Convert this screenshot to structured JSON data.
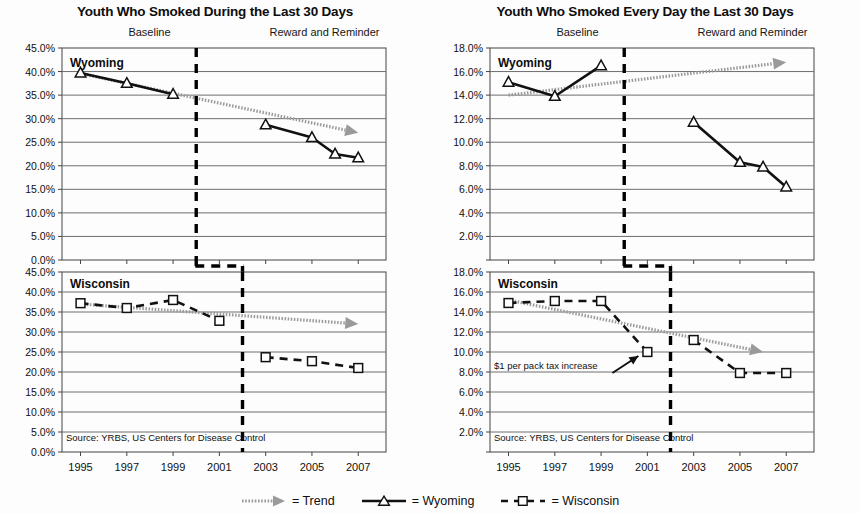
{
  "figure": {
    "legend": [
      {
        "key": "trend",
        "marker": "dotted-arrow",
        "label": "= Trend"
      },
      {
        "key": "wyoming",
        "marker": "solid-triangle",
        "label": "= Wyoming"
      },
      {
        "key": "wisconsin",
        "marker": "dashed-square",
        "label": "= Wisconsin"
      }
    ],
    "colors": {
      "series_line": "#111111",
      "trend_line": "#9a9a9a",
      "grid": "#6e6e6e",
      "axis": "#444444",
      "divider": "#000000",
      "background": "#ffffff"
    }
  },
  "charts": [
    {
      "id": "left",
      "title": "Youth Who Smoked During the Last 30 Days",
      "phase_labels": {
        "baseline": "Baseline",
        "intervention": "Reward and Reminder"
      },
      "xlabel": "",
      "ylabel": "",
      "xticks": [
        "1995",
        "1997",
        "1999",
        "2001",
        "2003",
        "2005",
        "2007"
      ],
      "x": [
        1995,
        1997,
        1999,
        2001,
        2003,
        2005,
        2007
      ],
      "yticks": [
        "0.0%",
        "5.0%",
        "10.0%",
        "15.0%",
        "20.0%",
        "25.0%",
        "30.0%",
        "35.0%",
        "40.0%",
        "45.0%"
      ],
      "ylim": [
        0,
        45
      ],
      "ystep": 5,
      "divider_year": 2002,
      "grid": true,
      "source_note": "Source: YRBS, US Centers for Disease Control",
      "panels": [
        {
          "state": "Wyoming",
          "series_name": "Wyoming",
          "baseline": {
            "x": [
              1995,
              1997,
              1999
            ],
            "values": [
              39.7,
              37.5,
              35.2
            ]
          },
          "intervention": {
            "x": [
              2003,
              2005,
              2006,
              2007
            ],
            "values": [
              28.7,
              26.0,
              22.5,
              21.7
            ]
          },
          "trend": {
            "x": [
              1995,
              2007
            ],
            "values": [
              39.6,
              27.0
            ]
          },
          "has_source_note": false,
          "annotation": null
        },
        {
          "state": "Wisconsin",
          "series_name": "Wisconsin",
          "baseline": {
            "x": [
              1995,
              1997,
              1999,
              2001
            ],
            "values": [
              37.2,
              36.0,
              38.0,
              32.8
            ]
          },
          "intervention": {
            "x": [
              2003,
              2005,
              2007
            ],
            "values": [
              23.7,
              22.7,
              21.0
            ]
          },
          "trend": {
            "x": [
              1995,
              2007
            ],
            "values": [
              37.0,
              32.0
            ]
          },
          "has_source_note": true,
          "annotation": null
        }
      ]
    },
    {
      "id": "right",
      "title": "Youth Who Smoked Every Day the Last 30 Days",
      "phase_labels": {
        "baseline": "Baseline",
        "intervention": "Reward and Reminder"
      },
      "xlabel": "",
      "ylabel": "",
      "xticks": [
        "1995",
        "1997",
        "1999",
        "2001",
        "2003",
        "2005",
        "2007"
      ],
      "x": [
        1995,
        1997,
        1999,
        2001,
        2003,
        2005,
        2007
      ],
      "yticks": [
        "2.0%",
        "4.0%",
        "6.0%",
        "8.0%",
        "10.0%",
        "12.0%",
        "14.0%",
        "16.0%",
        "18.0%"
      ],
      "ylim": [
        0,
        18
      ],
      "ystep": 2,
      "divider_year": 2002,
      "grid": true,
      "source_note": "Source: YRBS, US Centers for Disease Control",
      "panels": [
        {
          "state": "Wyoming",
          "series_name": "Wyoming",
          "baseline": {
            "x": [
              1995,
              1997,
              1999
            ],
            "values": [
              15.1,
              13.9,
              16.5
            ]
          },
          "intervention": {
            "x": [
              2003,
              2005,
              2006,
              2007
            ],
            "values": [
              11.7,
              8.3,
              7.9,
              6.2
            ]
          },
          "trend": {
            "x": [
              1995,
              2007
            ],
            "values": [
              14.0,
              16.8
            ]
          },
          "has_source_note": false,
          "annotation": null
        },
        {
          "state": "Wisconsin",
          "series_name": "Wisconsin",
          "baseline": {
            "x": [
              1995,
              1997,
              1999,
              2001
            ],
            "values": [
              14.9,
              15.1,
              15.1,
              10.0
            ]
          },
          "intervention": {
            "x": [
              2003,
              2005,
              2007
            ],
            "values": [
              11.2,
              7.9,
              7.9
            ]
          },
          "trend": {
            "x": [
              1995,
              2006
            ],
            "values": [
              15.2,
              10.0
            ]
          },
          "has_source_note": true,
          "annotation": {
            "text": "$1 per pack tax increase",
            "points_to_year": 2001,
            "points_to_value": 10.0
          }
        }
      ]
    }
  ],
  "chart_data": {
    "type": "line",
    "xlabel": "Year",
    "ylabel": "Percent of youth",
    "x": [
      1995,
      1997,
      1999,
      2001,
      2003,
      2005,
      2007
    ],
    "panels": [
      {
        "chart": "Youth Who Smoked During the Last 30 Days",
        "ylim": [
          0,
          45
        ],
        "yticks": [
          0,
          5,
          10,
          15,
          20,
          25,
          30,
          35,
          40,
          45
        ],
        "series": [
          {
            "name": "Wyoming",
            "x": [
              1995,
              1997,
              1999,
              2003,
              2005,
              2006,
              2007
            ],
            "values": [
              39.7,
              37.5,
              35.2,
              28.7,
              26.0,
              22.5,
              21.7
            ]
          },
          {
            "name": "Wyoming Trend",
            "x": [
              1995,
              2007
            ],
            "values": [
              39.6,
              27.0
            ]
          },
          {
            "name": "Wisconsin",
            "x": [
              1995,
              1997,
              1999,
              2001,
              2003,
              2005,
              2007
            ],
            "values": [
              37.2,
              36.0,
              38.0,
              32.8,
              23.7,
              22.7,
              21.0
            ]
          },
          {
            "name": "Wisconsin Trend",
            "x": [
              1995,
              2007
            ],
            "values": [
              37.0,
              32.0
            ]
          }
        ]
      },
      {
        "chart": "Youth Who Smoked Every Day the Last 30 Days",
        "ylim": [
          0,
          18
        ],
        "yticks": [
          2,
          4,
          6,
          8,
          10,
          12,
          14,
          16,
          18
        ],
        "series": [
          {
            "name": "Wyoming",
            "x": [
              1995,
              1997,
              1999,
              2003,
              2005,
              2006,
              2007
            ],
            "values": [
              15.1,
              13.9,
              16.5,
              11.7,
              8.3,
              7.9,
              6.2
            ]
          },
          {
            "name": "Wyoming Trend",
            "x": [
              1995,
              2007
            ],
            "values": [
              14.0,
              16.8
            ]
          },
          {
            "name": "Wisconsin",
            "x": [
              1995,
              1997,
              1999,
              2001,
              2003,
              2005,
              2007
            ],
            "values": [
              14.9,
              15.1,
              15.1,
              10.0,
              11.2,
              7.9,
              7.9
            ]
          },
          {
            "name": "Wisconsin Trend",
            "x": [
              1995,
              2006
            ],
            "values": [
              15.2,
              10.0
            ]
          }
        ],
        "annotations": [
          {
            "text": "$1 per pack tax increase",
            "x": 2001,
            "y": 10.0
          }
        ]
      }
    ],
    "legend": [
      "Trend",
      "Wyoming",
      "Wisconsin"
    ],
    "legend_position": "bottom-center",
    "grid": true,
    "notes": [
      "Source: YRBS, US Centers for Disease Control",
      "Baseline",
      "Reward and Reminder"
    ]
  }
}
